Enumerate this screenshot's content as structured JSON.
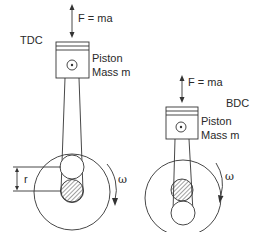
{
  "diagram": {
    "tdc": {
      "position_label": "TDC",
      "force_label": "F = ma",
      "piston_label": "Piston",
      "mass_label": "Mass m",
      "radius_label": "r",
      "rotation_label": "ω"
    },
    "bdc": {
      "position_label": "BDC",
      "force_label": "F = ma",
      "piston_label": "Piston",
      "mass_label": "Mass m",
      "rotation_label": "ω"
    },
    "colors": {
      "line": "#333333",
      "text": "#2a2a2a",
      "background": "#ffffff"
    }
  }
}
